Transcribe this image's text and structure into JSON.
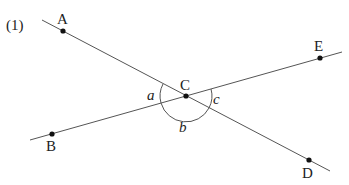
{
  "problem_number": "(1)",
  "points": {
    "A": {
      "label": "A",
      "x": 63,
      "y": 31
    },
    "B": {
      "label": "B",
      "x": 52,
      "y": 134
    },
    "C": {
      "label": "C",
      "x": 186,
      "y": 96
    },
    "D": {
      "label": "D",
      "x": 309,
      "y": 160
    },
    "E": {
      "label": "E",
      "x": 320,
      "y": 58
    }
  },
  "lines": [
    {
      "name": "line-AD",
      "through": [
        "A",
        "C",
        "D"
      ]
    },
    {
      "name": "line-BE",
      "through": [
        "B",
        "C",
        "E"
      ]
    }
  ],
  "angles": {
    "a": "a",
    "b": "b",
    "c": "c"
  },
  "colors": {
    "line": "#555555",
    "point": "#111111",
    "text": "#222222"
  }
}
